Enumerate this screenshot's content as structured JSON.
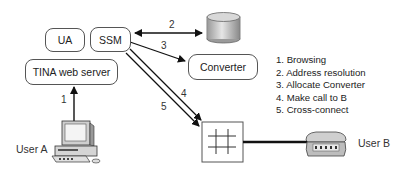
{
  "diagram": {
    "nodes": {
      "ua": "UA",
      "ssm": "SSM",
      "tina": "TINA web server",
      "converter": "Converter",
      "user_a": "User A",
      "user_b": "User B"
    },
    "edge_labels": {
      "e1": "1",
      "e2": "2",
      "e3": "3",
      "e4": "4",
      "e5": "5"
    },
    "legend": [
      "1. Browsing",
      "2. Address resolution",
      "3. Allocate Converter",
      "4. Make call to B",
      "5. Cross-connect"
    ]
  }
}
